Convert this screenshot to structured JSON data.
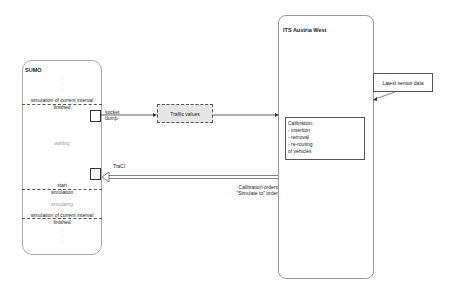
{
  "sumo": {
    "title": "SUMO",
    "top_dots": [
      ".",
      ".",
      "."
    ],
    "sim_finished_1_line1": "simulation of current interval",
    "sim_finished_1_line2": "finished",
    "waiting": "waiting",
    "start_line1": "start",
    "start_line2": "simulation",
    "simulating": "simulating",
    "sim_finished_2_line1": "simulation of current interval",
    "sim_finished_2_line2": "finished",
    "bottom_dots": [
      ".",
      ".",
      "."
    ]
  },
  "connections": {
    "socket_dump_line1": "socket",
    "socket_dump_line2": "dump",
    "traffic_values": "Traffic values",
    "traci": "TraCI",
    "calibration_orders_line1": "Calibration orders",
    "calibration_orders_line2": "\"Simulate to\" order"
  },
  "its": {
    "title": "ITS Austria West",
    "latest_sensor_data": "Latest sensor data",
    "calibration": {
      "heading": "Calibration:",
      "items": [
        "- insertion",
        "- removal",
        "- re-routing"
      ],
      "footer": "of vehicles"
    }
  },
  "colors": {
    "traffic_box_fill": "#e6e6e6",
    "line": "#333333",
    "box_border": "#aaaaaa"
  }
}
